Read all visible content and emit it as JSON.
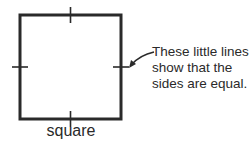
{
  "shape": {
    "name": "square",
    "label": "square",
    "stroke_color": "#2a2a2a"
  },
  "annotation": {
    "lines": [
      "These little lines",
      "show that the",
      "sides are equal."
    ]
  }
}
